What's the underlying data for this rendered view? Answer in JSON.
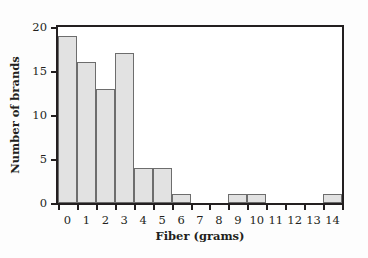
{
  "chart_data": {
    "type": "bar",
    "title": "",
    "subtitle": "",
    "xlabel": "Fiber (grams)",
    "ylabel": "Number of brands",
    "categories": [
      "0",
      "1",
      "2",
      "3",
      "4",
      "5",
      "6",
      "7",
      "8",
      "9",
      "10",
      "11",
      "12",
      "13",
      "14"
    ],
    "values": [
      19,
      16,
      13,
      17,
      4,
      4,
      1,
      0,
      0,
      1,
      1,
      0,
      0,
      0,
      1
    ],
    "xlim": [
      0,
      15
    ],
    "ylim": [
      0,
      20
    ],
    "x_tick_labels": [
      "0",
      "1",
      "2",
      "3",
      "4",
      "5",
      "6",
      "7",
      "8",
      "9",
      "10",
      "11",
      "12",
      "13",
      "14"
    ],
    "y_tick_labels": [
      "0",
      "5",
      "10",
      "15",
      "20"
    ],
    "y_tick_values": [
      0,
      5,
      10,
      15,
      20
    ],
    "grid": false,
    "legend": null,
    "annotations": [],
    "bar_fill_color": "#e2e2e2",
    "bar_edge_color": "#6d6d6d",
    "axis_color": "#231f20",
    "plot_background_color": "#ffffff",
    "figure_background_color": "#fdfdfd"
  }
}
